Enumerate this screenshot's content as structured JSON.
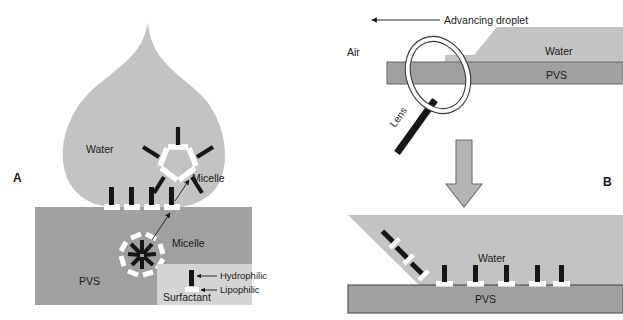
{
  "figure": {
    "panels": [
      {
        "id": "A",
        "label": "A"
      },
      {
        "id": "B",
        "label": "B"
      }
    ],
    "colors": {
      "water": "#c3c3c3",
      "pvs": "#a0a0a0",
      "legend_box": "#d4d4d4",
      "arrow_fill": "#b4b4b4",
      "outline": "#6e6e6e",
      "hydrophilic": "#161616",
      "lipophilic": "#ffffff",
      "text": "#1a1a1a",
      "background": "#ffffff"
    }
  },
  "panel_a": {
    "label": "A",
    "droplet_label": "Water",
    "substrate_label": "PVS",
    "micelle_water_label": "Micelle",
    "micelle_pvs_label": "Micelle",
    "surface_surfactant_count": 4,
    "micelle_water": {
      "type": "normal-micelle",
      "sides": 5,
      "head_color": "#ffffff",
      "tail_color": "#161616",
      "tail_direction": "outward",
      "tail_count": 5
    },
    "micelle_pvs": {
      "type": "reverse-micelle",
      "sides": 8,
      "head_color": "#ffffff",
      "tail_color": "#161616",
      "tail_direction": "inward",
      "tail_count": 8
    },
    "legend": {
      "title": "Surfactant",
      "items": [
        {
          "label": "Hydrophilic",
          "color": "#161616",
          "part": "head-bar-top"
        },
        {
          "label": "Lipophilic",
          "color": "#ffffff",
          "part": "tail-bar-bottom"
        }
      ]
    }
  },
  "panel_b": {
    "label": "B",
    "top_view": {
      "arrow_label": "Advancing droplet",
      "arrow_direction": "left",
      "air_label": "Air",
      "water_label": "Water",
      "substrate_label": "PVS",
      "lens_label": "Lens"
    },
    "transition_arrow": {
      "direction": "down"
    },
    "detail_view": {
      "water_label": "Water",
      "substrate_label": "PVS",
      "interface_surfactant_count": 3,
      "surface_surfactant_count": 5
    }
  }
}
